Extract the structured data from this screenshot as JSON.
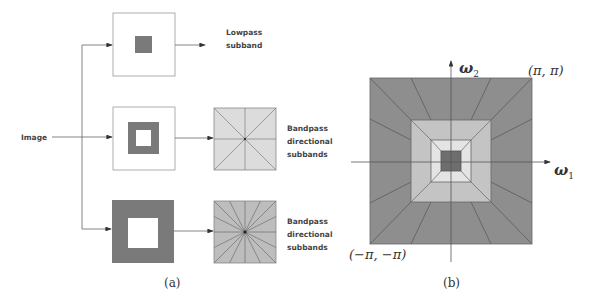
{
  "panel_a": {
    "input_label": "Image",
    "branches": [
      {
        "name": "lowpass",
        "label_line1": "Lowpass",
        "label_line2": "subband"
      },
      {
        "name": "bandpass-1",
        "label_line1": "Bandpass",
        "label_line2": "directional",
        "label_line3": "subbands",
        "directions": 8
      },
      {
        "name": "bandpass-2",
        "label_line1": "Bandpass",
        "label_line2": "directional",
        "label_line3": "subbands",
        "directions": 16
      }
    ],
    "caption": "(a)"
  },
  "panel_b": {
    "y_axis_label": "ω",
    "y_axis_sub": "2",
    "x_axis_label": "ω",
    "x_axis_sub": "1",
    "top_right_corner": "(π, π)",
    "bottom_left_corner": "(−π, −π)",
    "caption": "(b)"
  },
  "colors": {
    "dark": "#7a7a7a",
    "darker": "#666666",
    "mid": "#a6a6a6",
    "light": "#c8c8c8",
    "lighter": "#dddddd",
    "line": "#555555"
  }
}
